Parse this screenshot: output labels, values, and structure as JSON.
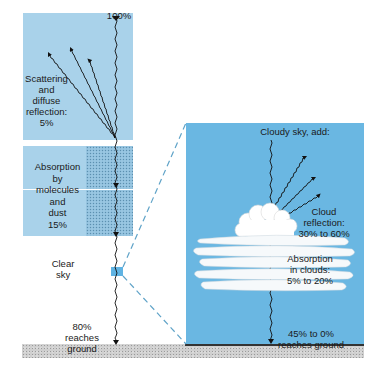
{
  "diagram": {
    "type": "atmospheric solar radiation budget",
    "clear_sky": {
      "incoming_label": "100%",
      "scattering_label": [
        "Scattering",
        "and diffuse",
        "reflection:",
        "5%"
      ],
      "absorption_label": [
        "Absorption",
        "by",
        "molecules",
        "and",
        "dust",
        "15%"
      ],
      "sky_label": [
        "Clear",
        "sky"
      ],
      "ground_label": [
        "80%",
        "reaches ground"
      ]
    },
    "cloudy_sky": {
      "header_label": "Cloudy sky, add:",
      "reflection_label": [
        "Cloud",
        "reflection:",
        "30% to 60%"
      ],
      "absorption_label": [
        "Absorption",
        "in clouds:",
        "5% to 20%"
      ],
      "ground_label": [
        "45% to 0%",
        "reaches ground"
      ]
    },
    "colors": {
      "light_panel": "#a9d2ea",
      "cloudy_panel": "#6ab7e2",
      "stipple": "#8fbfdc",
      "zoom_marker": "#5fb3e3",
      "dashed_line": "#5fa3c8",
      "ground": "#cfcfcf",
      "rays": "#111111"
    },
    "values": {
      "incoming_percent": 100,
      "scattering_percent": 5,
      "absorption_percent": 15,
      "clear_sky_ground_percent": 80,
      "cloud_reflection_percent_range": [
        30,
        60
      ],
      "cloud_absorption_percent_range": [
        5,
        20
      ],
      "cloudy_ground_percent_range": [
        45,
        0
      ]
    }
  }
}
